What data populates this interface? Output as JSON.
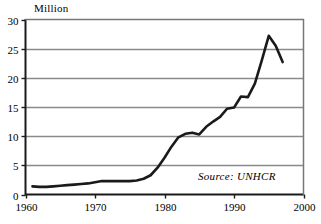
{
  "chart_data": {
    "type": "line",
    "title": "",
    "subtitle": "",
    "unit_label": "Million",
    "xlabel": "",
    "ylabel": "Million",
    "xlim": [
      1960,
      2000
    ],
    "ylim": [
      0,
      30
    ],
    "xticks": [
      1960,
      1970,
      1980,
      1990,
      2000
    ],
    "yticks": [
      0,
      5,
      10,
      15,
      20,
      25,
      30
    ],
    "grid": "horizontal",
    "legend": "none",
    "annotations": [
      "Source: UNHCR"
    ],
    "series": [
      {
        "name": "Refugees",
        "color": "#1a1a1a",
        "x": [
          1961,
          1962,
          1963,
          1964,
          1965,
          1966,
          1967,
          1968,
          1969,
          1970,
          1971,
          1972,
          1973,
          1974,
          1975,
          1976,
          1977,
          1978,
          1979,
          1980,
          1981,
          1982,
          1983,
          1984,
          1985,
          1986,
          1987,
          1988,
          1989,
          1990,
          1991,
          1992,
          1993,
          1994,
          1995,
          1996,
          1997
        ],
        "y": [
          1.4,
          1.3,
          1.3,
          1.4,
          1.5,
          1.6,
          1.7,
          1.8,
          1.9,
          2.1,
          2.3,
          2.3,
          2.3,
          2.3,
          2.3,
          2.4,
          2.7,
          3.3,
          4.6,
          6.3,
          8.2,
          9.8,
          10.4,
          10.6,
          10.3,
          11.6,
          12.5,
          13.3,
          14.7,
          14.9,
          16.8,
          16.7,
          19.0,
          23.0,
          27.2,
          25.5,
          22.7
        ]
      }
    ]
  },
  "axes": {
    "x_tick_labels": [
      "1960",
      "1970",
      "1980",
      "1990",
      "2000"
    ],
    "y_tick_labels": [
      "0",
      "5",
      "10",
      "15",
      "20",
      "25",
      "30"
    ]
  },
  "footer": {
    "source_text": "Source: UNHCR"
  }
}
